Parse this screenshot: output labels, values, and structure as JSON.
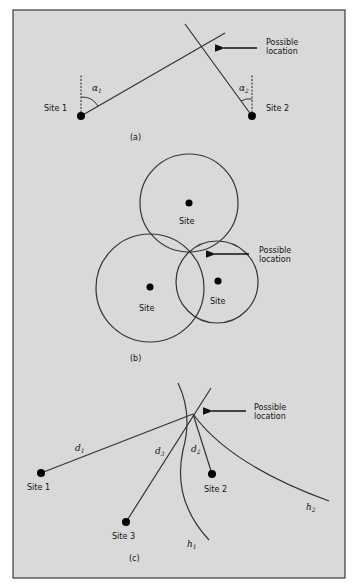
{
  "colors": {
    "background": "#ffffff",
    "panel": "#d9d9d9",
    "border": "#3a3a3a",
    "line": "#333333",
    "dot": "#000000"
  },
  "panel_a": {
    "caption": "(a)",
    "site1_label": "Site 1",
    "site2_label": "Site 2",
    "alpha1": "α",
    "alpha1_sub": "1",
    "alpha2": "α",
    "alpha2_sub": "2",
    "annotation_line1": "Possible",
    "annotation_line2": "location"
  },
  "panel_b": {
    "caption": "(b)",
    "site_top_label": "Site",
    "site_left_label": "Site",
    "site_right_label": "Site",
    "annotation_line1": "Possible",
    "annotation_line2": "location"
  },
  "panel_c": {
    "caption": "(c)",
    "site1_label": "Site 1",
    "site2_label": "Site 2",
    "site3_label": "Site 3",
    "d1": "d",
    "d1_sub": "1",
    "d2": "d",
    "d2_sub": "2",
    "d3": "d",
    "d3_sub": "3",
    "h1": "h",
    "h1_sub": "1",
    "h2": "h",
    "h2_sub": "2",
    "annotation_line1": "Possible",
    "annotation_line2": "location"
  }
}
